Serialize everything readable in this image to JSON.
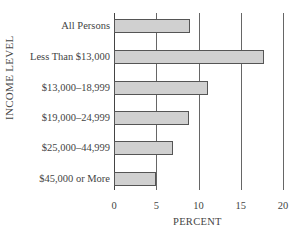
{
  "chart_data": {
    "type": "bar",
    "orientation": "horizontal",
    "title": "",
    "xlabel": "PERCENT",
    "ylabel": "INCOME LEVEL",
    "categories": [
      "All Persons",
      "Less Than $13,000",
      "$13,000–18,999",
      "$19,000–24,999",
      "$25,000–44,999",
      "$45,000 or More"
    ],
    "values": [
      9.0,
      17.7,
      11.1,
      8.9,
      7.0,
      5.0
    ],
    "xlim": [
      0,
      20
    ],
    "xticks": [
      "0",
      "5",
      "10",
      "15",
      "20"
    ],
    "grid": true,
    "bar_color": "#d0d0d0"
  }
}
